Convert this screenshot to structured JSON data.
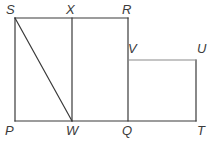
{
  "figure": {
    "background_color": "#ffffff",
    "stroke_color": "#3a3a3a",
    "light_stroke_color": "#8a8a8a",
    "label_color": "#3b3b3b",
    "stroke_width": 1.2,
    "width": 214,
    "height": 144,
    "points": {
      "S": {
        "label": "S",
        "x": 15,
        "y": 18
      },
      "X": {
        "label": "X",
        "x": 72,
        "y": 18
      },
      "R": {
        "label": "R",
        "x": 128,
        "y": 18
      },
      "V": {
        "label": "V",
        "x": 128,
        "y": 60
      },
      "U": {
        "label": "U",
        "x": 196,
        "y": 60
      },
      "P": {
        "label": "P",
        "x": 15,
        "y": 121
      },
      "W": {
        "label": "W",
        "x": 72,
        "y": 121
      },
      "Q": {
        "label": "Q",
        "x": 128,
        "y": 121
      },
      "T": {
        "label": "T",
        "x": 196,
        "y": 121
      }
    },
    "labels": [
      {
        "name": "vertex-label-S",
        "text": "S",
        "left": 6,
        "top": 3,
        "interactable": false
      },
      {
        "name": "vertex-label-X",
        "text": "X",
        "left": 66,
        "top": 3,
        "interactable": false
      },
      {
        "name": "vertex-label-R",
        "text": "R",
        "left": 122,
        "top": 3,
        "interactable": false
      },
      {
        "name": "vertex-label-V",
        "text": "V",
        "left": 128,
        "top": 42,
        "interactable": false
      },
      {
        "name": "vertex-label-U",
        "text": "U",
        "left": 197,
        "top": 42,
        "interactable": false
      },
      {
        "name": "vertex-label-P",
        "text": "P",
        "left": 5,
        "top": 124,
        "interactable": false
      },
      {
        "name": "vertex-label-W",
        "text": "W",
        "left": 66,
        "top": 124,
        "interactable": false
      },
      {
        "name": "vertex-label-Q",
        "text": "Q",
        "left": 122,
        "top": 124,
        "interactable": false
      },
      {
        "name": "vertex-label-T",
        "text": "T",
        "left": 197,
        "top": 124,
        "interactable": false
      }
    ],
    "segments": [
      {
        "name": "segment-SR-top-edge",
        "from": "S",
        "to": "R",
        "tone": "dark"
      },
      {
        "name": "segment-PT-bottom-edge",
        "from": "P",
        "to": "T",
        "tone": "dark"
      },
      {
        "name": "segment-SP-left-edge",
        "from": "S",
        "to": "P",
        "tone": "dark"
      },
      {
        "name": "segment-XW-vertical",
        "from": "X",
        "to": "W",
        "tone": "dark"
      },
      {
        "name": "segment-RQ-vertical",
        "from": "R",
        "to": "Q",
        "tone": "dark"
      },
      {
        "name": "segment-UT-right-edge",
        "from": "U",
        "to": "T",
        "tone": "dark"
      },
      {
        "name": "segment-VU-horizontal",
        "from": "V",
        "to": "U",
        "tone": "light"
      },
      {
        "name": "segment-SW-diagonal",
        "from": "S",
        "to": "W",
        "tone": "dark"
      }
    ]
  }
}
